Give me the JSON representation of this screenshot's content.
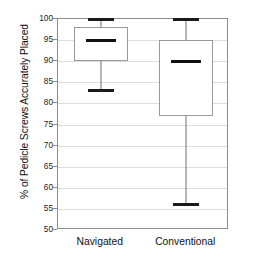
{
  "chart_data": {
    "type": "box",
    "title": "",
    "xlabel": "",
    "ylabel": "% of Pedicle Screws Accurately Placed",
    "ylim": [
      50,
      100
    ],
    "yticks": [
      100,
      95,
      90,
      85,
      80,
      75,
      70,
      65,
      60,
      55,
      50
    ],
    "ytick_labels": [
      "100",
      "95",
      "90",
      "85",
      "80",
      "75",
      "70",
      "65",
      "60",
      "55",
      "50"
    ],
    "grid": true,
    "legend": "none",
    "categories": [
      "Navigated",
      "Conventional"
    ],
    "boxes": [
      {
        "label": "Navigated",
        "min": 83,
        "q1": 90,
        "median": 95,
        "q3": 98,
        "max": 100
      },
      {
        "label": "Conventional",
        "min": 56,
        "q1": 77,
        "median": 90,
        "q3": 95,
        "max": 100
      }
    ]
  },
  "colors": {
    "axis": "#8d8d8d",
    "grid": "#dcdcdc",
    "box_edge": "#9a9a9a",
    "median": "#111111",
    "whisker": "#6f6f6f",
    "text": "#111111",
    "background": "#ffffff"
  }
}
